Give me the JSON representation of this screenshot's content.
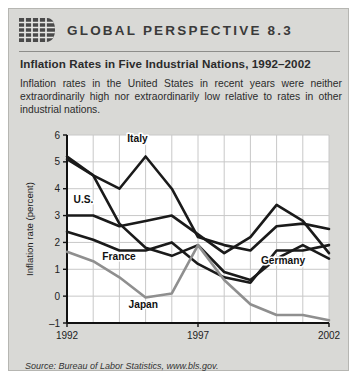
{
  "header": {
    "logo_icon": "globe-grid-icon",
    "kicker": "GLOBAL PERSPECTIVE 8.3",
    "subtitle": "Inflation Rates in Five Industrial Nations, 1992–2002",
    "blurb": "Inflation rates in the United States in recent years were neither extraordinarily high nor extraordinarily low relative to rates in other industrial nations."
  },
  "source": "Source: Bureau of Labor Statistics, www.bls.gov.",
  "colors": {
    "panel_background": "#d9d9d6",
    "plot_background": "#ffffff",
    "grid": "#c8c8c8",
    "axis": "#111111",
    "dark_series": "#1a1a1a",
    "japan_series": "#8f8f8f",
    "title_text": "#3a3a3a"
  },
  "chart_data": {
    "type": "line",
    "title": "Inflation Rates in Five Industrial Nations, 1992–2002",
    "xlabel": "",
    "ylabel": "Inflation rate (percent)",
    "xlim": [
      1992,
      2002
    ],
    "ylim": [
      -1,
      6
    ],
    "ytick_values": [
      -1,
      0,
      1,
      2,
      3,
      4,
      5,
      6
    ],
    "ytick_labels": [
      "–1",
      "0",
      "1",
      "2",
      "3",
      "4",
      "5",
      "6"
    ],
    "xtick_values": [
      1992,
      1997,
      2002
    ],
    "xtick_labels": [
      "1992",
      "1997",
      "2002"
    ],
    "grid": true,
    "legend": "inline-labels",
    "x": [
      1992,
      1993,
      1994,
      1995,
      1996,
      1997,
      1998,
      1999,
      2000,
      2001,
      2002
    ],
    "series": [
      {
        "name": "Italy",
        "color": "#1a1a1a",
        "label_x": 1994.3,
        "label_y": 5.75,
        "values": [
          5.2,
          4.5,
          4.0,
          5.2,
          4.0,
          2.2,
          1.9,
          1.7,
          2.6,
          2.7,
          2.5
        ]
      },
      {
        "name": "U.S.",
        "color": "#1a1a1a",
        "label_x": 1992.25,
        "label_y": 3.45,
        "values": [
          3.0,
          3.0,
          2.6,
          2.8,
          3.0,
          2.3,
          1.6,
          2.2,
          3.4,
          2.8,
          1.6
        ]
      },
      {
        "name": "France",
        "color": "#1a1a1a",
        "label_x": 1993.35,
        "label_y": 1.35,
        "values": [
          2.4,
          2.1,
          1.7,
          1.7,
          2.0,
          1.2,
          0.7,
          0.5,
          1.7,
          1.7,
          1.9
        ]
      },
      {
        "name": "Germany",
        "color": "#1a1a1a",
        "label_x": 1999.4,
        "label_y": 1.2,
        "values": [
          5.1,
          4.5,
          2.7,
          1.8,
          1.5,
          1.9,
          0.9,
          0.6,
          1.4,
          1.9,
          1.4
        ]
      },
      {
        "name": "Japan",
        "color": "#8f8f8f",
        "label_x": 1994.35,
        "label_y": -0.45,
        "values": [
          1.65,
          1.3,
          0.7,
          -0.05,
          0.1,
          1.9,
          0.6,
          -0.3,
          -0.7,
          -0.7,
          -0.9
        ]
      }
    ]
  }
}
